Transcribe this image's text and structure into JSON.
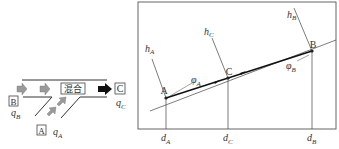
{
  "left_diagram": {
    "title": "mixing junction",
    "mix_label": "混合",
    "inlet_b_label": "B",
    "inlet_a_label": "A",
    "outlet_c_label": "C",
    "flow_b": {
      "symbol": "q",
      "sub": "B"
    },
    "flow_a": {
      "symbol": "q",
      "sub": "A"
    },
    "flow_c": {
      "symbol": "q",
      "sub": "C"
    }
  },
  "right_diagram": {
    "points": [
      {
        "name": "A",
        "h": {
          "symbol": "h",
          "sub": "A"
        },
        "d": {
          "symbol": "d",
          "sub": "A"
        },
        "phi": {
          "symbol": "φ",
          "sub": "A"
        }
      },
      {
        "name": "C",
        "h": {
          "symbol": "h",
          "sub": "C"
        },
        "d": {
          "symbol": "d",
          "sub": "C"
        }
      },
      {
        "name": "B",
        "h": {
          "symbol": "h",
          "sub": "B"
        },
        "d": {
          "symbol": "d",
          "sub": "B"
        },
        "phi": {
          "symbol": "φ",
          "sub": "B"
        }
      }
    ]
  },
  "colors": {
    "line": "#333333",
    "arrow_gray": "#9a9a9a",
    "arrow_black": "#111111",
    "frame": "#555555"
  }
}
